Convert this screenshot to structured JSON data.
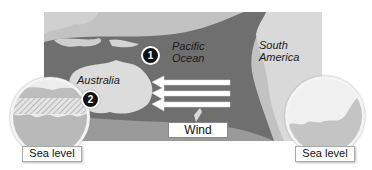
{
  "diagram": {
    "map_labels": {
      "pacific": "Pacific\nOcean",
      "pacific_line1": "Pacific",
      "pacific_line2": "Ocean",
      "south_america_line1": "South",
      "south_america_line2": "America",
      "australia": "Australia"
    },
    "markers": [
      {
        "id": "1",
        "label": "1"
      },
      {
        "id": "2",
        "label": "2"
      }
    ],
    "wind_label": "Wind",
    "wind_arrows": 3,
    "left_callout": {
      "label": "Sea level"
    },
    "right_callout": {
      "label": "Sea level"
    },
    "colors": {
      "land": "#d8d8d8",
      "shallow_sea": "#bdbdbd",
      "deep_ocean": "#6e6e6e",
      "arrow": "#ffffff",
      "marker": "#111111"
    }
  }
}
